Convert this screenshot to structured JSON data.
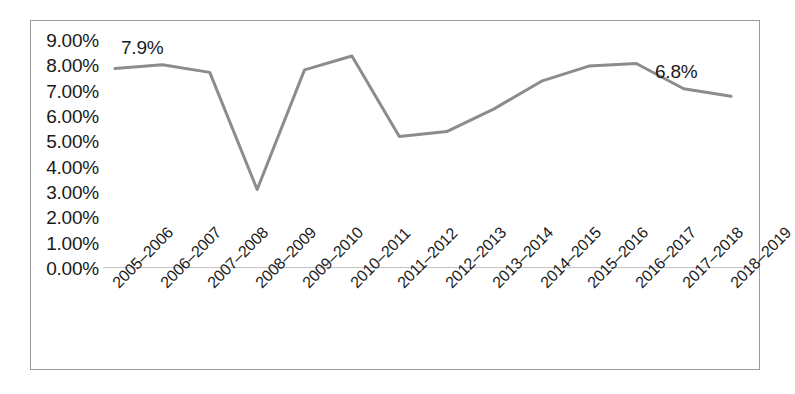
{
  "chart_data": {
    "type": "line",
    "title": "",
    "subtitle": "",
    "xlabel": "",
    "ylabel": "",
    "categories": [
      "2005–2006",
      "2006–2007",
      "2007–2008",
      "2008–2009",
      "2009–2010",
      "2010–2011",
      "2011–2012",
      "2012–2013",
      "2013–2014",
      "2014–2015",
      "2015–2016",
      "2016–2017",
      "2017–2018",
      "2018–2019"
    ],
    "values": [
      7.9,
      8.05,
      7.75,
      3.1,
      7.85,
      8.4,
      5.2,
      5.4,
      6.3,
      7.4,
      8.0,
      8.1,
      7.1,
      6.8
    ],
    "ylim": [
      0,
      9
    ],
    "ytick_values": [
      9,
      8,
      7,
      6,
      5,
      4,
      3,
      2,
      1,
      0
    ],
    "ytick_labels": [
      "9.00%",
      "8.00%",
      "7.00%",
      "6.00%",
      "5.00%",
      "4.00%",
      "3.00%",
      "2.00%",
      "1.00%",
      "0.00%"
    ],
    "grid": false,
    "legend": false,
    "legend_position": "none",
    "series_color": "#8c8c8c",
    "axis_color": "#bfbfbf",
    "border_color": "#9a9a9a",
    "text_color": "#1a1a1a",
    "data_labels": [
      {
        "index": 0,
        "text": "7.9%"
      },
      {
        "index": 13,
        "text": "6.8%"
      }
    ]
  }
}
